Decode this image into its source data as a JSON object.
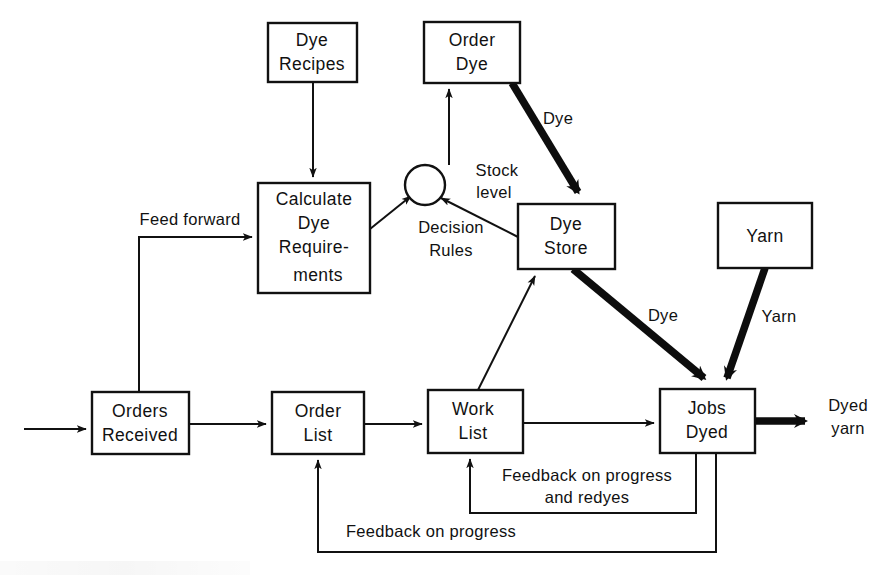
{
  "diagram": {
    "colors": {
      "ink": "#111111",
      "paper": "#ffffff",
      "thick_flow": "#0d0d0d"
    },
    "nodes": [
      {
        "id": "dye-recipes",
        "label_line1": "Dye",
        "label_line2": "Recipes",
        "x": 268,
        "y": 23,
        "w": 89,
        "h": 59
      },
      {
        "id": "order-dye",
        "label_line1": "Order",
        "label_line2": "Dye",
        "x": 424,
        "y": 22,
        "w": 96,
        "h": 61
      },
      {
        "id": "calculate-dye-requirements",
        "label_line1": "Calculate",
        "label_line2": "Dye",
        "label_line3": "Require-",
        "label_line4": "ments",
        "x": 258,
        "y": 183,
        "w": 112,
        "h": 110
      },
      {
        "id": "decision-node",
        "label_line1": "",
        "cx": 425,
        "cy": 185,
        "r": 20
      },
      {
        "id": "dye-store",
        "label_line1": "Dye",
        "label_line2": "Store",
        "x": 518,
        "y": 204,
        "w": 97,
        "h": 65
      },
      {
        "id": "yarn",
        "label_line1": "Yarn",
        "label_line2": "",
        "x": 718,
        "y": 203,
        "w": 94,
        "h": 65
      },
      {
        "id": "orders-received",
        "label_line1": "Orders",
        "label_line2": "Received",
        "x": 92,
        "y": 392,
        "w": 97,
        "h": 62
      },
      {
        "id": "order-list",
        "label_line1": "Order",
        "label_line2": "List",
        "x": 272,
        "y": 392,
        "w": 92,
        "h": 62
      },
      {
        "id": "work-list",
        "label_line1": "Work",
        "label_line2": "List",
        "x": 428,
        "y": 390,
        "w": 95,
        "h": 63
      },
      {
        "id": "jobs-dyed",
        "label_line1": "Jobs",
        "label_line2": "Dyed",
        "x": 660,
        "y": 389,
        "w": 95,
        "h": 64
      }
    ],
    "edge_labels": [
      {
        "id": "feed-forward",
        "text": "Feed forward",
        "x": 190,
        "y": 225
      },
      {
        "id": "dye-order-to-store",
        "text": "Dye",
        "x": 558,
        "y": 124
      },
      {
        "id": "stock-level-line1",
        "text": "Stock",
        "x": 497,
        "y": 176
      },
      {
        "id": "stock-level-line2",
        "text": "level",
        "x": 494,
        "y": 198
      },
      {
        "id": "decision-rules-line1",
        "text": "Decision",
        "x": 451,
        "y": 233
      },
      {
        "id": "decision-rules-line2",
        "text": "Rules",
        "x": 451,
        "y": 256
      },
      {
        "id": "dye-store-to-jobs",
        "text": "Dye",
        "x": 663,
        "y": 321
      },
      {
        "id": "yarn-to-jobs",
        "text": "Yarn",
        "x": 779,
        "y": 322
      },
      {
        "id": "dyed-yarn-line1",
        "text": "Dyed",
        "x": 848,
        "y": 411
      },
      {
        "id": "dyed-yarn-line2",
        "text": "yarn",
        "x": 848,
        "y": 434
      },
      {
        "id": "feedback-progress-redyes-line1",
        "text": "Feedback on progress",
        "x": 587,
        "y": 481
      },
      {
        "id": "feedback-progress-redyes-line2",
        "text": "and redyes",
        "x": 587,
        "y": 503
      },
      {
        "id": "feedback-progress",
        "text": "Feedback on progress",
        "x": 431,
        "y": 537
      }
    ],
    "flows": [
      {
        "id": "dye-recipes-to-calculate",
        "from": "dye-recipes",
        "to": "calculate-dye-requirements",
        "weight": "thin",
        "label": ""
      },
      {
        "id": "input-to-orders-received",
        "from": "external-input",
        "to": "orders-received",
        "weight": "thin",
        "label": ""
      },
      {
        "id": "orders-to-calculate",
        "from": "orders-received",
        "to": "calculate-dye-requirements",
        "weight": "thin",
        "label": "Feed forward"
      },
      {
        "id": "calculate-to-decision",
        "from": "calculate-dye-requirements",
        "to": "decision-node",
        "weight": "thin",
        "label": "Decision Rules"
      },
      {
        "id": "dye-store-to-decision",
        "from": "dye-store",
        "to": "decision-node",
        "weight": "thin",
        "label": "Stock level"
      },
      {
        "id": "decision-to-order-dye",
        "from": "decision-node",
        "to": "order-dye",
        "weight": "thin",
        "label": ""
      },
      {
        "id": "order-dye-to-dye-store",
        "from": "order-dye",
        "to": "dye-store",
        "weight": "thick",
        "label": "Dye"
      },
      {
        "id": "dye-store-to-jobs-dyed",
        "from": "dye-store",
        "to": "jobs-dyed",
        "weight": "thick",
        "label": "Dye"
      },
      {
        "id": "yarn-to-jobs-dyed",
        "from": "yarn",
        "to": "jobs-dyed",
        "weight": "thick",
        "label": "Yarn"
      },
      {
        "id": "orders-to-order-list",
        "from": "orders-received",
        "to": "order-list",
        "weight": "thin",
        "label": ""
      },
      {
        "id": "order-list-to-work-list",
        "from": "order-list",
        "to": "work-list",
        "weight": "thin",
        "label": ""
      },
      {
        "id": "work-list-to-jobs-dyed",
        "from": "work-list",
        "to": "jobs-dyed",
        "weight": "thin",
        "label": ""
      },
      {
        "id": "work-list-to-dye-store",
        "from": "work-list",
        "to": "dye-store",
        "weight": "thin",
        "label": ""
      },
      {
        "id": "jobs-dyed-to-output",
        "from": "jobs-dyed",
        "to": "dyed-yarn-output",
        "weight": "thick",
        "label": "Dyed yarn"
      },
      {
        "id": "jobs-dyed-to-work-list",
        "from": "jobs-dyed",
        "to": "work-list",
        "weight": "thin",
        "label": "Feedback on progress and redyes"
      },
      {
        "id": "jobs-dyed-to-order-list",
        "from": "jobs-dyed",
        "to": "order-list",
        "weight": "thin",
        "label": "Feedback on progress"
      }
    ]
  }
}
